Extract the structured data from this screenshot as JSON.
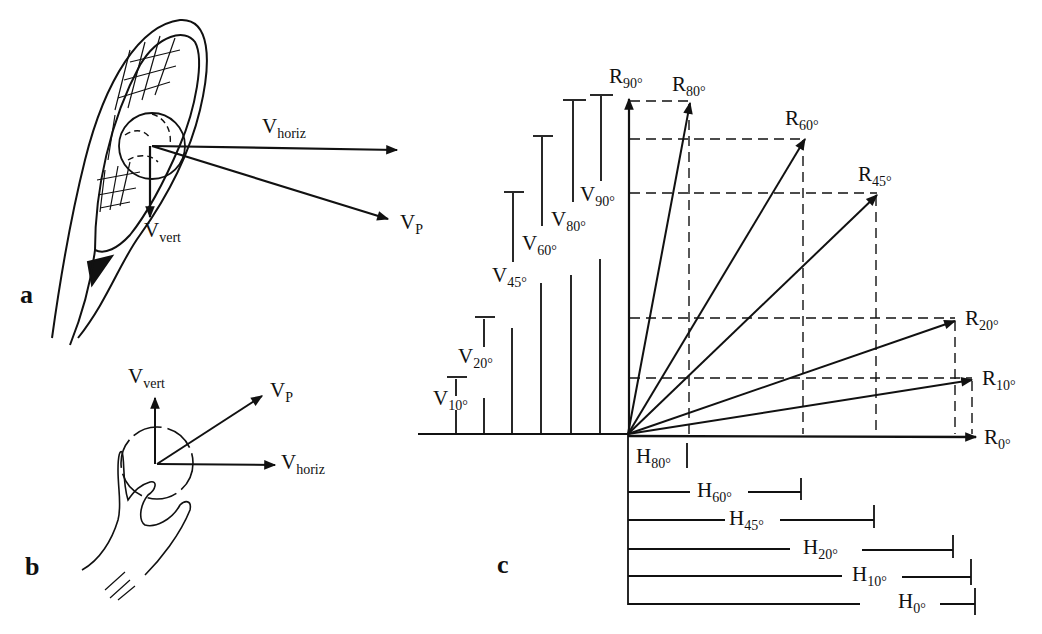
{
  "figure": {
    "panels": [
      {
        "letter": "a",
        "subject": "tennis racket striking ball"
      },
      {
        "letter": "b",
        "subject": "hand releasing ball"
      },
      {
        "letter": "c",
        "subject": "resultant vector decomposition"
      }
    ],
    "panel_a": {
      "letter": "a",
      "labels": {
        "horiz_main": "V",
        "horiz_sub": "horiz",
        "vert_main": "V",
        "vert_sub": "vert",
        "p_main": "V",
        "p_sub": "P"
      }
    },
    "panel_b": {
      "letter": "b",
      "labels": {
        "horiz_main": "V",
        "horiz_sub": "horiz",
        "vert_main": "V",
        "vert_sub": "vert",
        "p_main": "V",
        "p_sub": "P"
      }
    },
    "panel_c": {
      "letter": "c",
      "resultants": [
        {
          "main": "R",
          "sub": "0°",
          "angle": 0
        },
        {
          "main": "R",
          "sub": "10°",
          "angle": 10
        },
        {
          "main": "R",
          "sub": "20°",
          "angle": 20
        },
        {
          "main": "R",
          "sub": "45°",
          "angle": 45
        },
        {
          "main": "R",
          "sub": "60°",
          "angle": 60
        },
        {
          "main": "R",
          "sub": "80°",
          "angle": 80
        },
        {
          "main": "R",
          "sub": "90°",
          "angle": 90
        }
      ],
      "vertical_components": [
        {
          "main": "V",
          "sub": "10°"
        },
        {
          "main": "V",
          "sub": "20°"
        },
        {
          "main": "V",
          "sub": "45°"
        },
        {
          "main": "V",
          "sub": "60°"
        },
        {
          "main": "V",
          "sub": "80°"
        },
        {
          "main": "V",
          "sub": "90°"
        }
      ],
      "horizontal_components": [
        {
          "main": "H",
          "sub": "80°"
        },
        {
          "main": "H",
          "sub": "60°"
        },
        {
          "main": "H",
          "sub": "45°"
        },
        {
          "main": "H",
          "sub": "20°"
        },
        {
          "main": "H",
          "sub": "10°"
        },
        {
          "main": "H",
          "sub": "0°"
        }
      ]
    }
  },
  "colors": {
    "ink": "#111111",
    "background": "#ffffff"
  }
}
